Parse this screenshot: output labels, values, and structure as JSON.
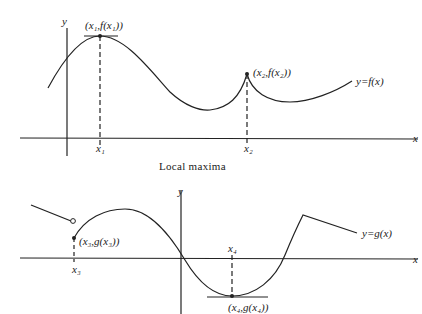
{
  "top_graph": {
    "y_axis_label": "y",
    "x_axis_label": "x",
    "curve_label": "y=f(x)",
    "point1_label": "(x₁,f(x₁))",
    "point2_label": "(x₂,f(x₂))",
    "tick1_label": "x₁",
    "tick2_label": "x₂",
    "caption": "Local maxima"
  },
  "bottom_graph": {
    "y_axis_label": "y",
    "x_axis_label": "x",
    "curve_label": "y=g(x)",
    "point3_label": "(x₃,g(x₃))",
    "point4_label": "(x₄,g(x₄))",
    "tick3_label": "x₃",
    "tick4_label": "x₄"
  },
  "colors": {
    "ink": "#222222",
    "background": "#ffffff"
  }
}
